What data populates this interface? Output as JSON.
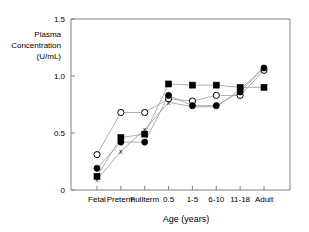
{
  "chart_data": {
    "type": "line",
    "title": "",
    "xlabel": "Age (years)",
    "ylabel": "Plasma Concentration (U/mL)",
    "ylabel_lines": [
      "Plasma",
      "Concentration",
      "(U/mL)"
    ],
    "categories": [
      "Fetal",
      "Preterm",
      "Fullterm",
      "0.5",
      "1-5",
      "6-10",
      "11-18",
      "Adult"
    ],
    "ylim": [
      0,
      1.5
    ],
    "yticks": [
      0,
      0.5,
      1.0,
      1.5
    ],
    "ytick_labels": [
      "0",
      "0.5",
      "1.0",
      "1.5"
    ],
    "grid": false,
    "legend": "none",
    "series": [
      {
        "name": "open-circle",
        "marker": "open-circle",
        "values": [
          0.31,
          0.68,
          0.68,
          0.8,
          0.78,
          0.83,
          0.83,
          1.05
        ]
      },
      {
        "name": "filled-circle",
        "marker": "filled-circle",
        "values": [
          0.19,
          0.42,
          0.42,
          0.83,
          0.74,
          0.74,
          0.86,
          1.07
        ]
      },
      {
        "name": "filled-square",
        "marker": "filled-square",
        "values": [
          0.12,
          0.46,
          0.49,
          0.93,
          0.92,
          0.92,
          0.9,
          0.9
        ]
      },
      {
        "name": "cross",
        "marker": "x",
        "values": [
          0.09,
          0.34,
          0.53,
          0.77,
          0.73,
          0.73,
          0.88,
          1.08
        ]
      }
    ]
  },
  "axes": {
    "x_title": "Age (years)",
    "y_title_lines": [
      "Plasma",
      "Concentration",
      "(U/mL)"
    ]
  }
}
